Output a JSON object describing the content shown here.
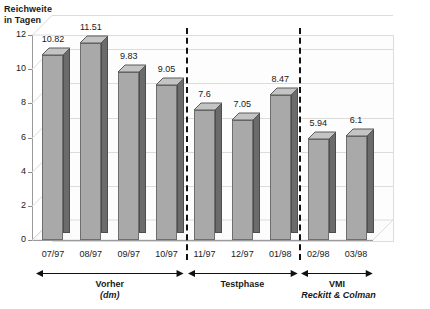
{
  "chart_data": {
    "type": "bar",
    "title_line1": "Reichweite",
    "title_line2": "in Tagen",
    "xlabel": "",
    "ylabel": "Reichweite in Tagen",
    "categories": [
      "07/97",
      "08/97",
      "09/97",
      "10/97",
      "11/97",
      "12/97",
      "01/98",
      "02/98",
      "03/98"
    ],
    "values": [
      10.82,
      11.51,
      9.83,
      9.05,
      7.6,
      7.05,
      8.47,
      5.94,
      6.1
    ],
    "value_labels": [
      "10.82",
      "11.51",
      "9.83",
      "9.05",
      "7.6",
      "7.05",
      "8.47",
      "5.94",
      "6.1"
    ],
    "ylim": [
      0,
      12
    ],
    "yticks": [
      0,
      2,
      4,
      6,
      8,
      10,
      12
    ],
    "ytick_labels": [
      "0",
      "2",
      "4",
      "6",
      "8",
      "10",
      "12"
    ],
    "grid": true,
    "legend": "none",
    "style": "3d-column",
    "bar_color": "#a9a9a9",
    "bar_side_color": "#6b6b6b",
    "bar_top_color": "#c4c4c4",
    "bar_edge_color": "#5a5a5a",
    "grid_color": "#dcdcdc",
    "axis_color": "#9a9a9a",
    "separators_after": [
      "10/97",
      "01/98"
    ],
    "phases": [
      {
        "name": "phase-vorher",
        "label": "Vorher",
        "sublabel": "(dm)",
        "sublabel_italic": true,
        "from": "07/97",
        "to": "10/97"
      },
      {
        "name": "phase-testphase",
        "label": "Testphase",
        "sublabel": "",
        "sublabel_italic": false,
        "from": "11/97",
        "to": "01/98"
      },
      {
        "name": "phase-vmi",
        "label": "VMI",
        "sublabel": "Reckitt & Colman",
        "sublabel_italic": true,
        "from": "02/98",
        "to": "03/98"
      }
    ]
  }
}
